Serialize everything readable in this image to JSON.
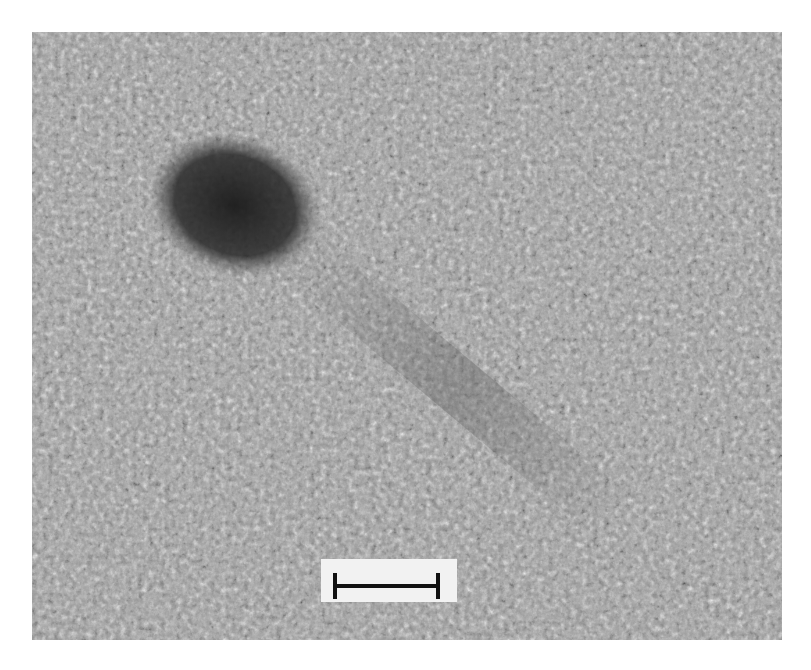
{
  "figure": {
    "type": "transmission electron micrograph",
    "colormap": "grayscale",
    "colors": {
      "background_gray": "#9a9a9a",
      "particle_dark": "#1a1a1a",
      "scalebar_box": "#f2f2f2",
      "scalebar": "#111111"
    },
    "features": [
      {
        "name": "dark-nanoparticle",
        "shape": "ellipse",
        "approx_center": [
          235,
          205
        ]
      },
      {
        "name": "nanowire-rod",
        "orientation": "diagonal, upper-left to lower-right"
      }
    ],
    "scale_bar": {
      "label": ""
    }
  }
}
